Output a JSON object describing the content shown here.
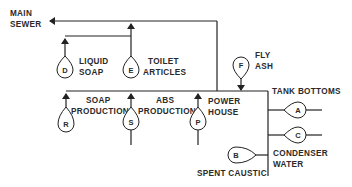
{
  "diagram": {
    "type": "wastewater flow diagram",
    "outlet": {
      "label_line1": "MAIN",
      "label_line2": "SEWER"
    },
    "sources": {
      "D": {
        "letter": "D",
        "label_line1": "LIQUID",
        "label_line2": "SOAP"
      },
      "E": {
        "letter": "E",
        "label_line1": "TOILET",
        "label_line2": "ARTICLES"
      },
      "F": {
        "letter": "F",
        "label_line1": "FLY",
        "label_line2": "ASH"
      },
      "R": {
        "letter": "R"
      },
      "S": {
        "letter": "S"
      },
      "P": {
        "letter": "P"
      },
      "A": {
        "letter": "A"
      },
      "C": {
        "letter": "C"
      },
      "B": {
        "letter": "B"
      }
    },
    "labels": {
      "soap_production_line1": "SOAP",
      "soap_production_line2": "PRODUCTION",
      "abs_production_line1": "ABS",
      "abs_production_line2": "PRODUCTION",
      "power_house_line1": "POWER",
      "power_house_line2": "HOUSE",
      "tank_bottoms": "TANK BOTTOMS",
      "condenser_water_line1": "CONDENSER",
      "condenser_water_line2": "WATER",
      "spent_caustic": "SPENT CAUSTIC"
    }
  }
}
